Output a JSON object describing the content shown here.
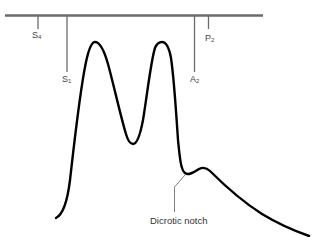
{
  "diagram": {
    "type": "pressure-waveform",
    "colors": {
      "baseline": "#6b6b6b",
      "ticks": "#6b6b6b",
      "curve": "#000000",
      "label": "#444444",
      "leader": "#808080"
    },
    "markers": [
      {
        "id": "S4",
        "base": "S",
        "sub": "4"
      },
      {
        "id": "S1",
        "base": "S",
        "sub": "1"
      },
      {
        "id": "A2",
        "base": "A",
        "sub": "2"
      },
      {
        "id": "P2",
        "base": "P",
        "sub": "2"
      }
    ],
    "annotation": {
      "label": "Dicrotic notch"
    }
  }
}
